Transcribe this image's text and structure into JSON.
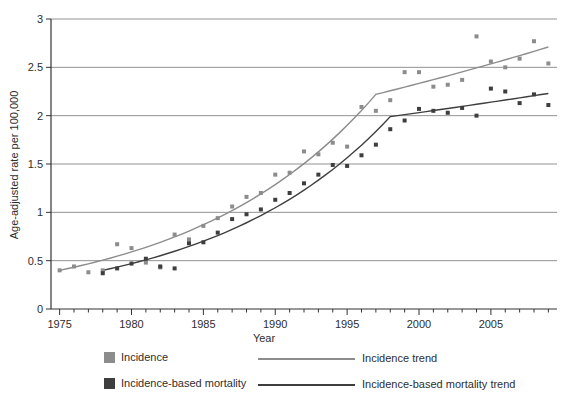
{
  "figure": {
    "background": "#ffffff",
    "text_color": "#2e2e2e",
    "axis_color": "#333333",
    "gridline_color": "#929292"
  },
  "chart_data": {
    "type": "scatter",
    "title": "",
    "xlabel": "Year",
    "ylabel": "Age-adjusted rate per 100,000",
    "xlim": [
      1974.4,
      2009.6
    ],
    "ylim": [
      0,
      3
    ],
    "grid": "horizontal gridlines at every y tick",
    "legend_position": "bottom",
    "yticks": [
      0,
      0.5,
      1,
      1.5,
      2,
      2.5,
      3
    ],
    "ytick_labels": [
      "0",
      "0.5",
      "1",
      "1.5",
      "2",
      "2.5",
      "3"
    ],
    "xticks_major": [
      1975,
      1980,
      1985,
      1990,
      1995,
      2000,
      2005
    ],
    "xtick_major_labels": [
      "1975",
      "1980",
      "1985",
      "1990",
      "1995",
      "2000",
      "2005"
    ],
    "xticks_minor": {
      "start": 1975,
      "end": 2009,
      "step": 1
    },
    "series": [
      {
        "name": "Incidence",
        "marker": "square",
        "color": "#8c8c8c",
        "x": [
          1975,
          1976,
          1977,
          1978,
          1979,
          1980,
          1981,
          1982,
          1983,
          1984,
          1985,
          1986,
          1987,
          1988,
          1989,
          1990,
          1991,
          1992,
          1993,
          1994,
          1995,
          1996,
          1997,
          1998,
          1999,
          2000,
          2001,
          2002,
          2003,
          2004,
          2005,
          2006,
          2007,
          2008,
          2009
        ],
        "y": [
          0.4,
          0.44,
          0.38,
          0.4,
          0.67,
          0.63,
          0.48,
          0.43,
          0.77,
          0.72,
          0.86,
          0.94,
          1.06,
          1.16,
          1.2,
          1.39,
          1.41,
          1.63,
          1.6,
          1.72,
          1.68,
          2.09,
          2.05,
          2.16,
          2.45,
          2.45,
          2.3,
          2.32,
          2.37,
          2.82,
          2.56,
          2.5,
          2.59,
          2.77,
          2.54
        ]
      },
      {
        "name": "Incidence-based mortality",
        "marker": "square",
        "color": "#3e3e3e",
        "x": [
          1978,
          1979,
          1980,
          1981,
          1982,
          1983,
          1984,
          1985,
          1986,
          1987,
          1988,
          1989,
          1990,
          1991,
          1992,
          1993,
          1994,
          1995,
          1996,
          1997,
          1998,
          1999,
          2000,
          2001,
          2002,
          2003,
          2004,
          2005,
          2006,
          2007,
          2008,
          2009
        ],
        "y": [
          0.37,
          0.42,
          0.47,
          0.52,
          0.44,
          0.42,
          0.68,
          0.69,
          0.79,
          0.93,
          0.98,
          1.03,
          1.13,
          1.2,
          1.3,
          1.39,
          1.49,
          1.48,
          1.59,
          1.7,
          1.86,
          1.95,
          2.07,
          2.05,
          2.03,
          2.08,
          2.0,
          2.28,
          2.25,
          2.13,
          2.22,
          2.11
        ]
      }
    ],
    "trends": [
      {
        "name": "Incidence trend",
        "color": "#8c8c8c",
        "interpolation": "log-linear between joinpoints",
        "joinpoints": [
          [
            1975,
            0.4
          ],
          [
            1997,
            2.22
          ],
          [
            2009,
            2.71
          ]
        ]
      },
      {
        "name": "Incidence-based mortality trend",
        "color": "#3e3e3e",
        "interpolation": "log-linear between joinpoints",
        "joinpoints": [
          [
            1978,
            0.4
          ],
          [
            1998,
            1.99
          ],
          [
            2009,
            2.23
          ]
        ]
      }
    ]
  }
}
